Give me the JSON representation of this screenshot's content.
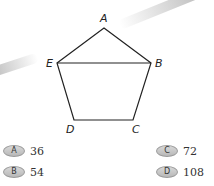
{
  "figure": {
    "shape": "pentagon",
    "vertices": [
      {
        "label": "A",
        "x": 104,
        "y": 28
      },
      {
        "label": "B",
        "x": 151,
        "y": 63
      },
      {
        "label": "C",
        "x": 133,
        "y": 120
      },
      {
        "label": "D",
        "x": 74,
        "y": 120
      },
      {
        "label": "E",
        "x": 57,
        "y": 63
      }
    ],
    "segments": [
      "AB",
      "BC",
      "CD",
      "DE",
      "EA",
      "EB"
    ],
    "labels": {
      "A": "A",
      "B": "B",
      "C": "C",
      "D": "D",
      "E": "E"
    },
    "stroke_color": "#222222"
  },
  "choices": [
    {
      "letter": "A",
      "value": "36"
    },
    {
      "letter": "B",
      "value": "54"
    },
    {
      "letter": "C",
      "value": "72"
    },
    {
      "letter": "D",
      "value": "108"
    }
  ]
}
